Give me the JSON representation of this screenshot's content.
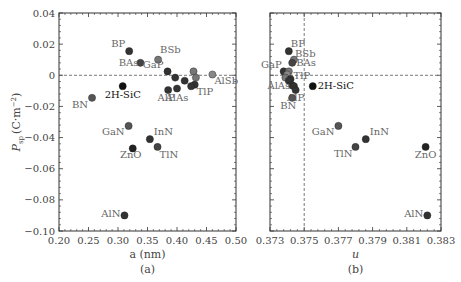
{
  "chart_data": [
    {
      "type": "scatter",
      "panel": "(a)",
      "title": "",
      "xlabel": "a (nm)",
      "ylabel": "P_sp (C·m⁻²)",
      "xlim": [
        0.2,
        0.5
      ],
      "ylim": [
        -0.1,
        0.04
      ],
      "xticks": [
        "0.20",
        "0.25",
        "0.30",
        "0.35",
        "0.40",
        "0.45",
        "0.50"
      ],
      "yticks": [
        "0.04",
        "0.02",
        "0",
        "−0.02",
        "−0.04",
        "−0.06",
        "−0.08",
        "−0.10"
      ],
      "reference_lines": [
        {
          "axis": "y",
          "value": 0,
          "style": "dashed"
        }
      ],
      "points": [
        {
          "label": "BP",
          "x": 0.319,
          "y": 0.0155,
          "color": "#333333"
        },
        {
          "label": "BAs",
          "x": 0.338,
          "y": 0.008,
          "color": "#444444"
        },
        {
          "label": "BSb",
          "x": 0.368,
          "y": 0.01,
          "color": "#777777"
        },
        {
          "label": "GaP",
          "x": 0.384,
          "y": 0.0025,
          "color": "#333333"
        },
        {
          "label": "",
          "x": 0.397,
          "y": -0.0015,
          "color": "#333333"
        },
        {
          "label": "",
          "x": 0.413,
          "y": -0.0035,
          "color": "#333333"
        },
        {
          "label": "",
          "x": 0.428,
          "y": 0.0025,
          "color": "#777777"
        },
        {
          "label": "",
          "x": 0.432,
          "y": -0.0015,
          "color": "#777777"
        },
        {
          "label": "AlSb",
          "x": 0.46,
          "y": 0.0005,
          "color": "#888888"
        },
        {
          "label": "TlP",
          "x": 0.43,
          "y": -0.006,
          "color": "#333333"
        },
        {
          "label": "",
          "x": 0.424,
          "y": -0.007,
          "color": "#333333"
        },
        {
          "label": "AlP",
          "x": 0.385,
          "y": -0.0095,
          "color": "#333333"
        },
        {
          "label": "AlAs",
          "x": 0.4,
          "y": -0.0085,
          "color": "#333333"
        },
        {
          "label": "2H-SiC",
          "x": 0.308,
          "y": -0.007,
          "color": "#111111"
        },
        {
          "label": "BN",
          "x": 0.256,
          "y": -0.0145,
          "color": "#555555"
        },
        {
          "label": "GaN",
          "x": 0.318,
          "y": -0.0325,
          "color": "#555555"
        },
        {
          "label": "InN",
          "x": 0.354,
          "y": -0.041,
          "color": "#333333"
        },
        {
          "label": "ZnO",
          "x": 0.325,
          "y": -0.047,
          "color": "#222222"
        },
        {
          "label": "TlN",
          "x": 0.367,
          "y": -0.046,
          "color": "#444444"
        },
        {
          "label": "AlN",
          "x": 0.311,
          "y": -0.09,
          "color": "#333333"
        }
      ]
    },
    {
      "type": "scatter",
      "panel": "(b)",
      "title": "",
      "xlabel": "u",
      "ylabel": "",
      "xlim": [
        0.373,
        0.383
      ],
      "ylim": [
        -0.1,
        0.04
      ],
      "xticks": [
        "0.373",
        "0.375",
        "0.377",
        "0.379",
        "0.381",
        "0.383"
      ],
      "reference_lines": [
        {
          "axis": "y",
          "value": 0,
          "style": "dashed"
        },
        {
          "axis": "x",
          "value": 0.375,
          "style": "dashed"
        }
      ],
      "points": [
        {
          "label": "BP",
          "x": 0.3741,
          "y": 0.0155,
          "color": "#333333"
        },
        {
          "label": "BSb",
          "x": 0.3744,
          "y": 0.01,
          "color": "#777777"
        },
        {
          "label": "BAs",
          "x": 0.3743,
          "y": 0.008,
          "color": "#444444"
        },
        {
          "label": "GaP",
          "x": 0.3738,
          "y": 0.0025,
          "color": "#333333"
        },
        {
          "label": "",
          "x": 0.3741,
          "y": 0.0025,
          "color": "#777777"
        },
        {
          "label": "",
          "x": 0.374,
          "y": 0.0005,
          "color": "#888888"
        },
        {
          "label": "",
          "x": 0.3739,
          "y": -0.0015,
          "color": "#777777"
        },
        {
          "label": "TlP",
          "x": 0.3742,
          "y": -0.0025,
          "color": "#333333"
        },
        {
          "label": "",
          "x": 0.3741,
          "y": -0.0035,
          "color": "#333333"
        },
        {
          "label": "AlAs",
          "x": 0.3743,
          "y": -0.0065,
          "color": "#333333"
        },
        {
          "label": "",
          "x": 0.3744,
          "y": -0.007,
          "color": "#333333"
        },
        {
          "label": "AlP",
          "x": 0.3745,
          "y": -0.0095,
          "color": "#333333"
        },
        {
          "label": "2H-SiC",
          "x": 0.3755,
          "y": -0.007,
          "color": "#111111"
        },
        {
          "label": "BN",
          "x": 0.3743,
          "y": -0.0145,
          "color": "#555555"
        },
        {
          "label": "GaN",
          "x": 0.377,
          "y": -0.0325,
          "color": "#555555"
        },
        {
          "label": "InN",
          "x": 0.3786,
          "y": -0.041,
          "color": "#333333"
        },
        {
          "label": "TlN",
          "x": 0.378,
          "y": -0.046,
          "color": "#444444"
        },
        {
          "label": "ZnO",
          "x": 0.3821,
          "y": -0.046,
          "color": "#222222"
        },
        {
          "label": "AlN",
          "x": 0.3822,
          "y": -0.09,
          "color": "#333333"
        }
      ]
    }
  ],
  "panels": {
    "a": {
      "caption": "(a)",
      "xlabel": "a (nm)",
      "ylabel_main": "P",
      "ylabel_sub": "sp",
      "ylabel_unit": "(C·m",
      "ylabel_exp": "−2",
      "ylabel_close": ")"
    },
    "b": {
      "caption": "(b)",
      "xlabel": "u"
    }
  }
}
